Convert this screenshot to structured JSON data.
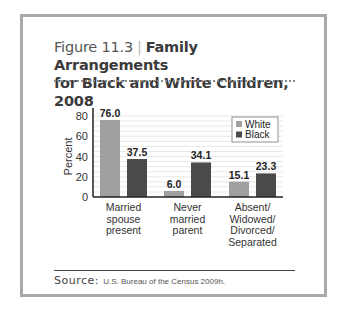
{
  "figure": {
    "number": "Figure 11.3",
    "separator": "|",
    "title_line1": "Family Arrangements",
    "title_line2": "for Black and White Children, 2008"
  },
  "source": {
    "label": "Source:",
    "text": "U.S. Bureau of the Census 2009h."
  },
  "chart_data": {
    "type": "bar",
    "title": "Family Arrangements for Black and White Children, 2008",
    "xlabel": "",
    "ylabel": "Percent",
    "ylim": [
      0,
      80
    ],
    "yticks": [
      0,
      20,
      40,
      60,
      80
    ],
    "grid": true,
    "legend_position": "upper right",
    "categories": [
      "Married spouse present",
      "Never married parent",
      "Absent/ Widowed/ Divorced/ Separated"
    ],
    "category_lines": [
      [
        "Married",
        "spouse",
        "present"
      ],
      [
        "Never",
        "married",
        "parent"
      ],
      [
        "Absent/",
        "Widowed/",
        "Divorced/",
        "Separated"
      ]
    ],
    "series": [
      {
        "name": "White",
        "color": "#a0a0a0",
        "values": [
          76.0,
          6.0,
          15.1
        ],
        "labels": [
          "76.0",
          "6.0",
          "15.1"
        ]
      },
      {
        "name": "Black",
        "color": "#4a4a4a",
        "values": [
          37.5,
          34.1,
          23.3
        ],
        "labels": [
          "37.5",
          "34.1",
          "23.3"
        ]
      }
    ]
  }
}
